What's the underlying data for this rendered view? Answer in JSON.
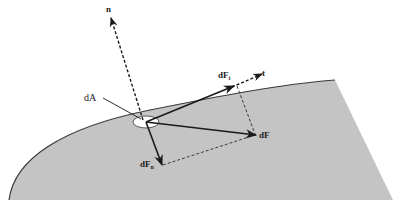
{
  "figure": {
    "type": "force-decomposition-diagram",
    "colors": {
      "surface_fill": "#c4c4c4",
      "surface_edge": "#3a3a3a",
      "ink": "#1a1a1a",
      "area_element_fill": "#ffffff",
      "background": "#ffffff"
    },
    "labels": {
      "normal_vector": "n",
      "area_element": "dA",
      "force": "dF",
      "tangential_force": "dF",
      "tangential_force_sub": "t",
      "tangent_vector": "t",
      "normal_force": "dF",
      "normal_force_sub": "n"
    }
  }
}
